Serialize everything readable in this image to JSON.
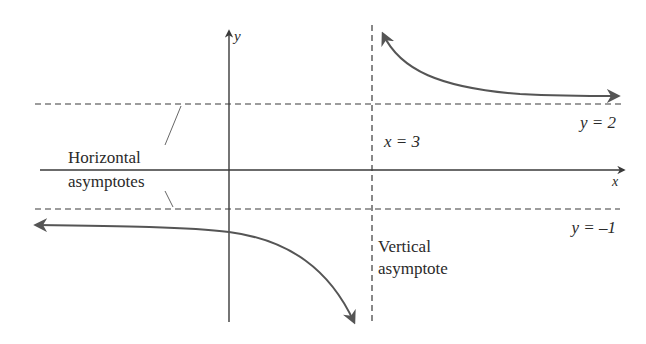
{
  "diagram": {
    "title": "",
    "axes": {
      "x_label": "x",
      "y_label": "y"
    },
    "asymptotes": {
      "horizontal_upper_label": "y = 2",
      "horizontal_lower_label": "y = –1",
      "vertical_label": "x = 3",
      "horizontal_caption_line1": "Horizontal",
      "horizontal_caption_line2": "asymptotes",
      "vertical_caption_line1": "Vertical",
      "vertical_caption_line2": "asymptote"
    },
    "colors": {
      "axis": "#3a3a3a",
      "curve": "#555555",
      "dashed": "#3a3a3a",
      "text": "#2a2a2a"
    }
  }
}
